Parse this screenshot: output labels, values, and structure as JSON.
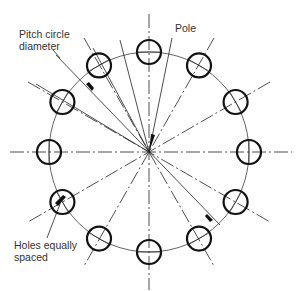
{
  "diagram": {
    "labels": {
      "pitch_line1": "Pitch circle",
      "pitch_line2": "diameter",
      "pole": "Pole",
      "holes_line1": "Holes equally",
      "holes_line2": "spaced"
    },
    "geometry": {
      "center": [
        149,
        152
      ],
      "pitch_radius": 100,
      "hole_radius": 12,
      "hole_count": 12,
      "angle_step_deg": 30
    },
    "colors": {
      "stroke": "#222222",
      "text": "#333333",
      "background": "#ffffff"
    }
  }
}
